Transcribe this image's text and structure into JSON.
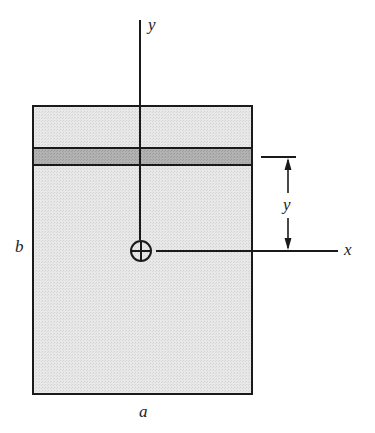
{
  "diagram": {
    "type": "cross-section",
    "colors": {
      "section_fill": "#e6e6e6",
      "strip_fill": "#aaaaaa",
      "stroke": "#1a1a1a",
      "background": "#ffffff"
    },
    "labels": {
      "y_axis": "y",
      "x_axis": "x",
      "width": "a",
      "height": "b",
      "strip_distance": "y"
    },
    "geometry": {
      "rect": {
        "x": 33,
        "y": 106,
        "width": 219,
        "height": 288
      },
      "strip": {
        "y_top": 148,
        "y_bottom": 165
      },
      "centroid": {
        "cx": 141,
        "cy": 251,
        "r": 10
      },
      "y_axis_line": {
        "x": 140,
        "y1": 20,
        "y2": 240
      },
      "x_axis_line": {
        "x1": 156,
        "x2": 338,
        "y": 251
      },
      "dimension": {
        "x": 288,
        "tick_x1": 261,
        "tick_x2": 296,
        "y_top": 157,
        "y_bottom": 251
      }
    }
  }
}
